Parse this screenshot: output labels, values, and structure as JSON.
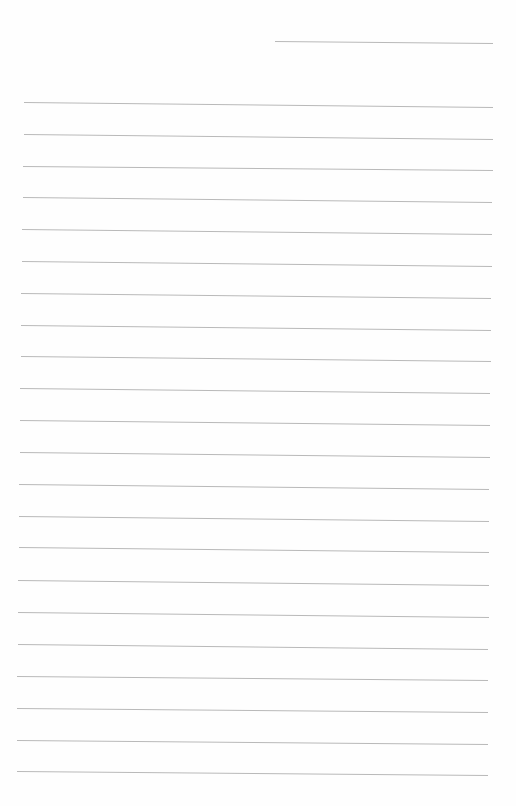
{
  "page": {
    "type": "blank lined paper",
    "background": "#fefefe",
    "line_color": "#b9b9b9",
    "header_line": {
      "x1": 275,
      "y1": 41,
      "x2": 493,
      "y2": 43
    },
    "ruled_lines": [
      {
        "x1": 24,
        "y1": 102,
        "x2": 493,
        "y2": 107
      },
      {
        "x1": 24,
        "y1": 134,
        "x2": 493,
        "y2": 139
      },
      {
        "x1": 23,
        "y1": 166,
        "x2": 493,
        "y2": 170
      },
      {
        "x1": 23,
        "y1": 197,
        "x2": 492,
        "y2": 202
      },
      {
        "x1": 22,
        "y1": 229,
        "x2": 492,
        "y2": 234
      },
      {
        "x1": 22,
        "y1": 261,
        "x2": 492,
        "y2": 266
      },
      {
        "x1": 21,
        "y1": 293,
        "x2": 491,
        "y2": 298
      },
      {
        "x1": 21,
        "y1": 325,
        "x2": 491,
        "y2": 330
      },
      {
        "x1": 21,
        "y1": 356,
        "x2": 491,
        "y2": 361
      },
      {
        "x1": 20,
        "y1": 388,
        "x2": 490,
        "y2": 393
      },
      {
        "x1": 20,
        "y1": 420,
        "x2": 490,
        "y2": 425
      },
      {
        "x1": 20,
        "y1": 452,
        "x2": 490,
        "y2": 457
      },
      {
        "x1": 19,
        "y1": 484,
        "x2": 489,
        "y2": 489
      },
      {
        "x1": 19,
        "y1": 516,
        "x2": 489,
        "y2": 521
      },
      {
        "x1": 19,
        "y1": 547,
        "x2": 489,
        "y2": 552
      },
      {
        "x1": 18,
        "y1": 580,
        "x2": 489,
        "y2": 585
      },
      {
        "x1": 18,
        "y1": 612,
        "x2": 489,
        "y2": 617
      },
      {
        "x1": 18,
        "y1": 644,
        "x2": 488,
        "y2": 649
      },
      {
        "x1": 17,
        "y1": 676,
        "x2": 488,
        "y2": 680
      },
      {
        "x1": 17,
        "y1": 708,
        "x2": 488,
        "y2": 712
      },
      {
        "x1": 17,
        "y1": 740,
        "x2": 488,
        "y2": 744
      },
      {
        "x1": 17,
        "y1": 771,
        "x2": 488,
        "y2": 775
      }
    ]
  }
}
